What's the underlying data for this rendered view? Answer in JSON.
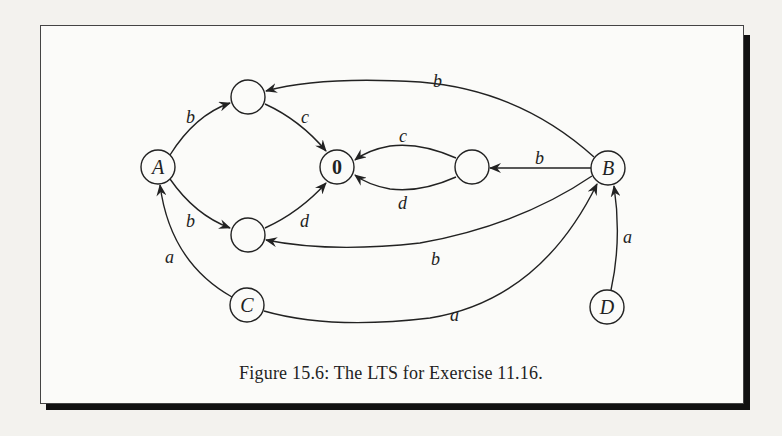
{
  "figure": {
    "caption": "Figure 15.6: The LTS for Exercise 11.16.",
    "colors": {
      "stroke": "#222222",
      "frame_shadow": "#111111",
      "paper": "#fbfbf9"
    }
  },
  "nodes": [
    {
      "id": "A",
      "label": "A",
      "x": 158,
      "y": 167
    },
    {
      "id": "top",
      "label": "",
      "x": 248,
      "y": 97
    },
    {
      "id": "zero",
      "label": "0",
      "x": 337,
      "y": 167
    },
    {
      "id": "mid",
      "label": "",
      "x": 472,
      "y": 167
    },
    {
      "id": "B",
      "label": "B",
      "x": 608,
      "y": 168
    },
    {
      "id": "bot",
      "label": "",
      "x": 248,
      "y": 235
    },
    {
      "id": "C",
      "label": "C",
      "x": 247,
      "y": 305
    },
    {
      "id": "D",
      "label": "D",
      "x": 607,
      "y": 307
    }
  ],
  "edges": [
    {
      "from": "A",
      "to": "top",
      "label": "b"
    },
    {
      "from": "top",
      "to": "zero",
      "label": "c"
    },
    {
      "from": "A",
      "to": "bot",
      "label": "b"
    },
    {
      "from": "bot",
      "to": "zero",
      "label": "d"
    },
    {
      "from": "mid",
      "to": "zero",
      "label": "c"
    },
    {
      "from": "mid",
      "to": "zero",
      "label": "d"
    },
    {
      "from": "B",
      "to": "mid",
      "label": "b"
    },
    {
      "from": "B",
      "to": "top",
      "label": "b"
    },
    {
      "from": "B",
      "to": "bot",
      "label": "b"
    },
    {
      "from": "C",
      "to": "A",
      "label": "a"
    },
    {
      "from": "C",
      "to": "B",
      "label": "a"
    },
    {
      "from": "D",
      "to": "B",
      "label": "a"
    }
  ],
  "labels": {
    "A": "A",
    "B": "B",
    "C": "C",
    "D": "D",
    "zero": "0",
    "e_A_top": "b",
    "e_top_zero": "c",
    "e_A_bot": "b",
    "e_bot_zero": "d",
    "e_mid_zero_c": "c",
    "e_mid_zero_d": "d",
    "e_B_mid": "b",
    "e_B_top": "b",
    "e_B_bot": "b",
    "e_C_A": "a",
    "e_C_B": "a",
    "e_D_B": "a"
  }
}
